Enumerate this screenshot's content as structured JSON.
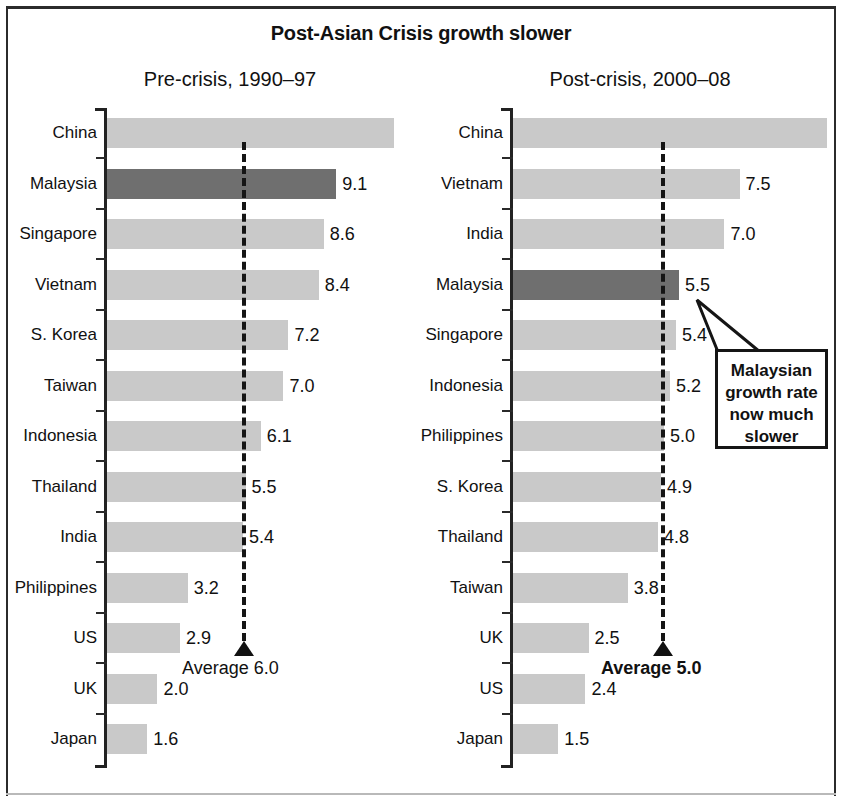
{
  "title": "Post-Asian Crisis growth slower",
  "colors": {
    "bar": "#c9c9c9",
    "bar_highlight": "#6f6f6f",
    "axis": "#222222",
    "text": "#111111"
  },
  "chart_data": [
    {
      "type": "bar",
      "orientation": "horizontal",
      "title": "Pre-crisis, 1990–97",
      "xlabel": "",
      "ylabel": "",
      "grid": false,
      "legend": "none",
      "xlim": [
        0,
        12
      ],
      "average": 6.0,
      "average_label": "Average 6.0",
      "average_label_bold": false,
      "highlight_category": "Malaysia",
      "categories": [
        "China",
        "Malaysia",
        "Singapore",
        "Vietnam",
        "S. Korea",
        "Taiwan",
        "Indonesia",
        "Thailand",
        "India",
        "Philippines",
        "US",
        "UK",
        "Japan"
      ],
      "values": [
        11.4,
        9.1,
        8.6,
        8.4,
        7.2,
        7.0,
        6.1,
        5.5,
        5.4,
        3.2,
        2.9,
        2.0,
        1.6
      ],
      "value_labels": [
        "",
        "9.1",
        "8.6",
        "8.4",
        "7.2",
        "7.0",
        "6.1",
        "5.5",
        "5.4",
        "3.2",
        "2.9",
        "2.0",
        "1.6"
      ]
    },
    {
      "type": "bar",
      "orientation": "horizontal",
      "title": "Post-crisis, 2000–08",
      "xlabel": "",
      "ylabel": "",
      "grid": false,
      "legend": "none",
      "xlim": [
        0,
        11
      ],
      "average": 5.0,
      "average_label": "Average 5.0",
      "average_label_bold": true,
      "highlight_category": "Malaysia",
      "categories": [
        "China",
        "Vietnam",
        "India",
        "Malaysia",
        "Singapore",
        "Indonesia",
        "Philippines",
        "S. Korea",
        "Thailand",
        "Taiwan",
        "UK",
        "US",
        "Japan"
      ],
      "values": [
        10.4,
        7.5,
        7.0,
        5.5,
        5.4,
        5.2,
        5.0,
        4.9,
        4.8,
        3.8,
        2.5,
        2.4,
        1.5
      ],
      "value_labels": [
        "",
        "7.5",
        "7.0",
        "5.5",
        "5.4",
        "5.2",
        "5.0",
        "4.9",
        "4.8",
        "3.8",
        "2.5",
        "2.4",
        "1.5"
      ],
      "annotation": {
        "lines": [
          "Malaysian",
          "growth rate",
          "now much",
          "slower"
        ],
        "points_to": "Malaysia"
      }
    }
  ]
}
